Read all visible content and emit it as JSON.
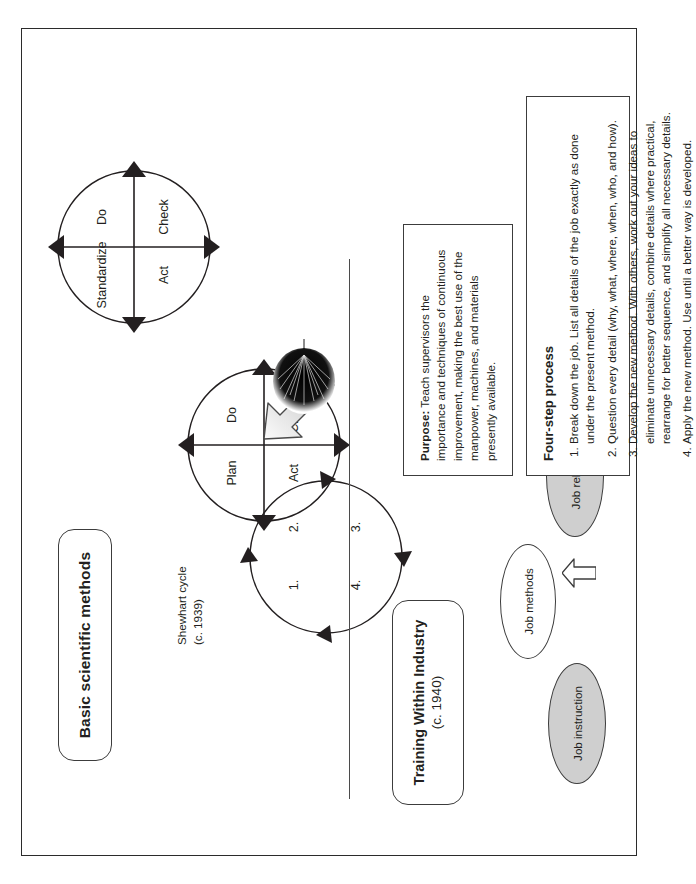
{
  "top_section": {
    "title_box": {
      "label": "Basic scientific methods"
    },
    "sdca_cycle": {
      "name": "sdca-cycle",
      "quadrants": [
        "Standardize",
        "Do",
        "Check",
        "Act"
      ]
    },
    "pdca_cycle": {
      "name": "pdca-cycle",
      "quadrants": [
        "Plan",
        "Do",
        "Check",
        "Act"
      ]
    },
    "numbered_cycle": {
      "name": "shewhart-cycle",
      "quadrants": [
        "1.",
        "2.",
        "3.",
        "4."
      ],
      "caption_line1": "Shewhart cycle",
      "caption_line2": "(c. 1939)"
    },
    "gray_arrow": {
      "name": "evolution-arrow"
    }
  },
  "bottom_section": {
    "title_box": {
      "label": "Training Within Industry",
      "sub": "(c. 1940)"
    },
    "pillars": [
      {
        "label": "Job instruction",
        "fill": "#cfcfcf"
      },
      {
        "label": "Job methods",
        "fill": "#ffffff"
      },
      {
        "label": "Job relations",
        "fill": "#cfcfcf"
      }
    ],
    "purpose": {
      "lead": "Purpose:",
      "body": " Teach supervisors the importance and techniques of continuous improvement, making the best use of the manpower, machines, and materials presently available."
    },
    "process": {
      "heading": "Four-step process",
      "steps": [
        "Break down the job. List all details of the job exactly as done under the present method.",
        "Question every detail (why, what, where, when, who, and how).",
        "Develop the new method. With others, work out your ideas to eliminate unnecessary details, combine details where practical, rearrange for better sequence, and simplify all necessary details.",
        "Apply the new method. Use until a better way is developed."
      ]
    },
    "tree_graphic": {
      "name": "tree-illustration"
    }
  },
  "colors": {
    "ink": "#231f20",
    "rule": "#3c3c3c",
    "ellipse_gray": "#cfcfcf",
    "arrow_gray_light": "#f2f2f2",
    "arrow_gray_dark": "#a8a8a8"
  }
}
